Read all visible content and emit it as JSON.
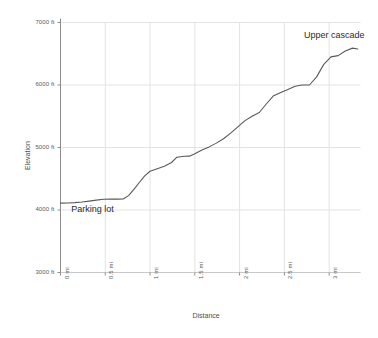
{
  "chart_data": {
    "type": "line",
    "title": "",
    "xlabel": "Distance",
    "ylabel": "Elevation",
    "xlim": [
      0,
      3.35
    ],
    "ylim": [
      3000,
      7000
    ],
    "grid": true,
    "legend": "none",
    "line_color": "#595959",
    "x_tick_labels": [
      "0 mi",
      "0.5 mi",
      "1 mi",
      "1.5 mi",
      "2 mi",
      "2.5 mi",
      "3 mi"
    ],
    "x_tick_values": [
      0,
      0.5,
      1,
      1.5,
      2,
      2.5,
      3
    ],
    "y_tick_labels": [
      "3000 ft",
      "4000 ft",
      "5000 ft",
      "6000 ft",
      "7000 ft"
    ],
    "y_tick_values": [
      3000,
      4000,
      5000,
      6000,
      7000
    ],
    "series": [
      {
        "name": "Trail elevation profile",
        "x": [
          0.0,
          0.08,
          0.16,
          0.24,
          0.32,
          0.4,
          0.48,
          0.56,
          0.64,
          0.7,
          0.76,
          0.82,
          0.88,
          0.94,
          1.0,
          1.08,
          1.16,
          1.24,
          1.3,
          1.38,
          1.44,
          1.5,
          1.58,
          1.66,
          1.74,
          1.82,
          1.9,
          1.98,
          2.06,
          2.14,
          2.22,
          2.3,
          2.38,
          2.46,
          2.54,
          2.62,
          2.7,
          2.78,
          2.86,
          2.94,
          3.02,
          3.1,
          3.18,
          3.26,
          3.32
        ],
        "y": [
          4110,
          4112,
          4118,
          4128,
          4142,
          4158,
          4172,
          4176,
          4174,
          4176,
          4230,
          4330,
          4440,
          4545,
          4620,
          4660,
          4700,
          4760,
          4845,
          4860,
          4862,
          4900,
          4960,
          5010,
          5070,
          5140,
          5230,
          5330,
          5430,
          5500,
          5560,
          5700,
          5830,
          5880,
          5930,
          5980,
          6000,
          6000,
          6130,
          6330,
          6450,
          6470,
          6545,
          6590,
          6575
        ]
      }
    ],
    "annotations": [
      {
        "text": "Parking lot",
        "x": 0.12,
        "y": 4000
      },
      {
        "text": "Upper cascade",
        "x": 2.72,
        "y": 6790
      }
    ]
  }
}
